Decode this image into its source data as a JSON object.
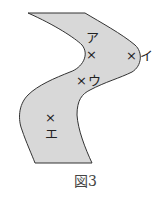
{
  "figure": {
    "caption": "図3",
    "fill_color": "#d8d8d8",
    "stroke_color": "#333333",
    "points": [
      {
        "id": "a",
        "label": "ア",
        "marker": "×"
      },
      {
        "id": "i",
        "label": "イ",
        "marker": "×"
      },
      {
        "id": "u",
        "label": "ウ",
        "marker": "×"
      },
      {
        "id": "e",
        "label": "エ",
        "marker": "×"
      }
    ]
  }
}
